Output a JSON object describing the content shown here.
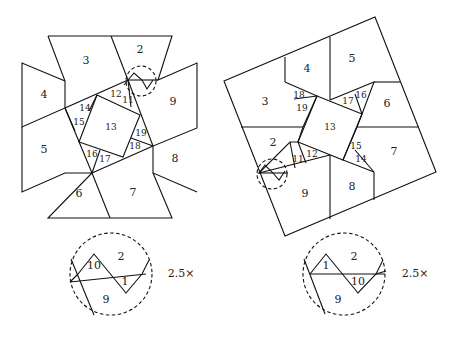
{
  "left_figure": {
    "pieces": [
      {
        "id": "2",
        "x": 140,
        "y": 50
      },
      {
        "id": "3",
        "x": 86,
        "y": 61
      },
      {
        "id": "4",
        "x": 44,
        "y": 95
      },
      {
        "id": "5",
        "x": 44,
        "y": 150
      },
      {
        "id": "6",
        "x": 79,
        "y": 194
      },
      {
        "id": "7",
        "x": 133,
        "y": 193
      },
      {
        "id": "8",
        "x": 175,
        "y": 159
      },
      {
        "id": "9",
        "x": 173,
        "y": 102
      },
      {
        "id": "11",
        "x": 128,
        "y": 100
      },
      {
        "id": "12",
        "x": 116,
        "y": 94
      },
      {
        "id": "13",
        "x": 111,
        "y": 127
      },
      {
        "id": "14",
        "x": 85,
        "y": 108
      },
      {
        "id": "15",
        "x": 79,
        "y": 122
      },
      {
        "id": "16",
        "x": 92,
        "y": 154
      },
      {
        "id": "17",
        "x": 105,
        "y": 159
      },
      {
        "id": "18",
        "x": 135,
        "y": 146
      },
      {
        "id": "19",
        "x": 141,
        "y": 133
      }
    ]
  },
  "right_figure": {
    "pieces": [
      {
        "id": "2",
        "x": 273,
        "y": 143
      },
      {
        "id": "3",
        "x": 265,
        "y": 102
      },
      {
        "id": "4",
        "x": 307,
        "y": 69
      },
      {
        "id": "5",
        "x": 352,
        "y": 59
      },
      {
        "id": "6",
        "x": 387,
        "y": 104
      },
      {
        "id": "7",
        "x": 394,
        "y": 152
      },
      {
        "id": "8",
        "x": 352,
        "y": 187
      },
      {
        "id": "9",
        "x": 305,
        "y": 194
      },
      {
        "id": "11",
        "x": 298,
        "y": 159
      },
      {
        "id": "12",
        "x": 312,
        "y": 154
      },
      {
        "id": "13",
        "x": 330,
        "y": 127
      },
      {
        "id": "14",
        "x": 361,
        "y": 159
      },
      {
        "id": "15",
        "x": 356,
        "y": 146
      },
      {
        "id": "16",
        "x": 361,
        "y": 95
      },
      {
        "id": "17",
        "x": 348,
        "y": 101
      },
      {
        "id": "18",
        "x": 299,
        "y": 95
      },
      {
        "id": "19",
        "x": 302,
        "y": 108
      }
    ]
  },
  "insets": [
    {
      "name": "left-inset",
      "labels": [
        {
          "id": "10",
          "x": 94,
          "y": 266
        },
        {
          "id": "2",
          "x": 121,
          "y": 257
        },
        {
          "id": "1",
          "x": 125,
          "y": 282
        },
        {
          "id": "9",
          "x": 106,
          "y": 300
        }
      ],
      "scale": "2.5×",
      "scale_x": 171,
      "scale_y": 274
    },
    {
      "name": "right-inset",
      "labels": [
        {
          "id": "1",
          "x": 326,
          "y": 266
        },
        {
          "id": "2",
          "x": 354,
          "y": 257
        },
        {
          "id": "10",
          "x": 358,
          "y": 282
        },
        {
          "id": "9",
          "x": 338,
          "y": 300
        }
      ],
      "scale": "2.5×",
      "scale_x": 405,
      "scale_y": 274
    }
  ]
}
